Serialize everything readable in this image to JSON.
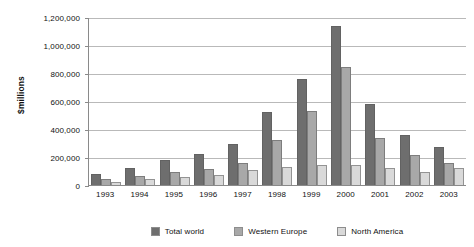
{
  "chart_data": {
    "type": "bar",
    "title": "",
    "subtitle": "",
    "xlabel": "",
    "ylabel": "$millions",
    "categories": [
      "1993",
      "1994",
      "1995",
      "1996",
      "1997",
      "1998",
      "1999",
      "2000",
      "2001",
      "2002",
      "2003"
    ],
    "series": [
      {
        "name": "Total world",
        "color": "#6e6e6e",
        "values": [
          80000,
          125000,
          180000,
          220000,
          295000,
          520000,
          755000,
          1135000,
          580000,
          360000,
          275000
        ]
      },
      {
        "name": "Western Europe",
        "color": "#a8a8a8",
        "values": [
          45000,
          65000,
          90000,
          115000,
          160000,
          320000,
          530000,
          840000,
          335000,
          215000,
          155000
        ]
      },
      {
        "name": "North America",
        "color": "#d9d9d9",
        "values": [
          25000,
          40000,
          55000,
          75000,
          110000,
          130000,
          140000,
          140000,
          125000,
          90000,
          120000
        ]
      }
    ],
    "ylim": [
      0,
      1200000
    ],
    "ytick_values": [
      0,
      200000,
      400000,
      600000,
      800000,
      1000000,
      1200000
    ],
    "ytick_labels": [
      "0",
      "200,000",
      "400,000",
      "600,000",
      "800,000",
      "1,000,000",
      "1,200,000"
    ],
    "grid": true,
    "legend_position": "bottom"
  }
}
